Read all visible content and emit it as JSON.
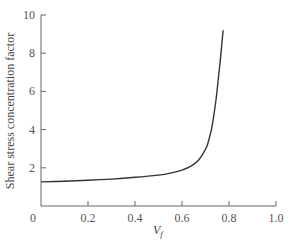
{
  "chart_data": {
    "type": "line",
    "title": "",
    "xlabel": "V_f",
    "xlabel_main": "V",
    "xlabel_sub": "f",
    "ylabel": "Shear stress concentration factor",
    "xlim": [
      0,
      1.0
    ],
    "ylim": [
      0,
      10
    ],
    "grid": false,
    "legend": null,
    "x_ticks": [
      0.2,
      0.4,
      0.6,
      0.8,
      1.0
    ],
    "x_tick_labels": [
      "0",
      "0.2",
      "0.4",
      "0.6",
      "0.8",
      "1.0"
    ],
    "y_ticks": [
      2,
      4,
      6,
      8,
      10
    ],
    "y_tick_labels": [
      "2",
      "4",
      "6",
      "8",
      "10"
    ],
    "series": [
      {
        "name": "Shear stress concentration factor",
        "x": [
          0.0,
          0.1,
          0.2,
          0.3,
          0.4,
          0.5,
          0.55,
          0.6,
          0.64,
          0.67,
          0.69,
          0.705,
          0.715,
          0.725,
          0.735,
          0.745,
          0.755,
          0.765,
          0.775
        ],
        "y": [
          1.26,
          1.3,
          1.35,
          1.41,
          1.5,
          1.62,
          1.72,
          1.88,
          2.1,
          2.4,
          2.75,
          3.1,
          3.5,
          4.0,
          4.7,
          5.6,
          6.7,
          7.9,
          9.2
        ]
      }
    ]
  }
}
